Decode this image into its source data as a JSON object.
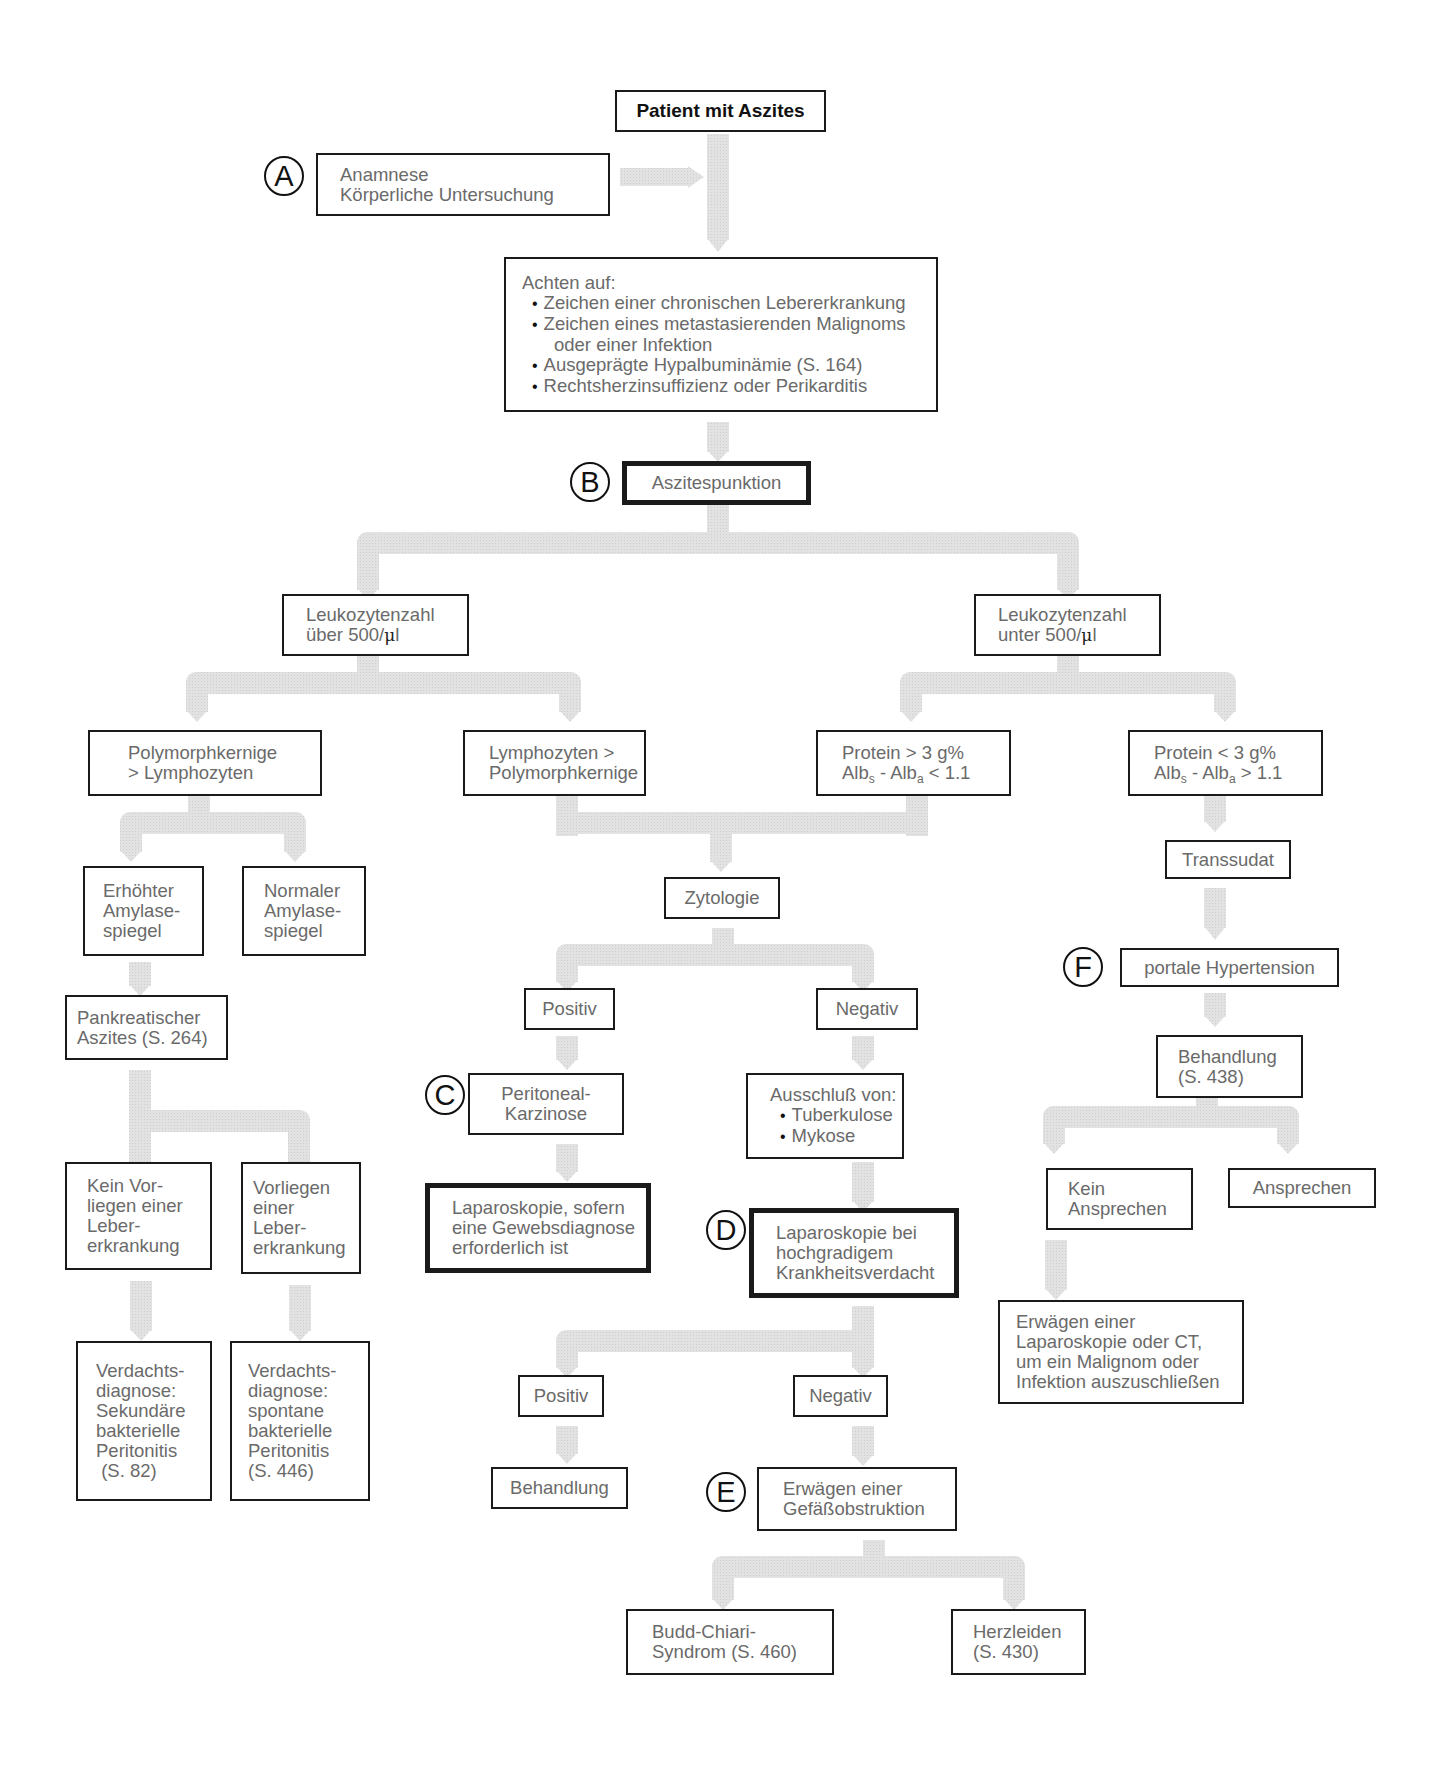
{
  "diagram": {
    "title": "Patient mit Aszites",
    "markers": [
      "A",
      "B",
      "C",
      "D",
      "E",
      "F"
    ],
    "connector_color": "#dcdcdc",
    "border_color": "#1a1a1a",
    "text_color": "#6a6a6a"
  },
  "nodes": {
    "anamnese": {
      "lines": [
        "Anamnese",
        "Körperliche Untersuchung"
      ]
    },
    "achten": {
      "heading": "Achten auf:",
      "bullets": [
        "Zeichen einer chronischen Lebererkrankung",
        "Zeichen eines metastasierenden Malignoms",
        "Ausgeprägte Hypalbuminämie (S. 164)",
        "Rechtsherzinsuffizienz oder Perikarditis"
      ],
      "bullet2_continuation": "oder einer Infektion"
    },
    "punktion": {
      "label": "Aszitespunktion"
    },
    "leuko_hoch": {
      "line1": "Leukozytenzahl",
      "line2_prefix": "über 500/",
      "unit_mu": "μ",
      "unit_l": "l"
    },
    "leuko_niedrig": {
      "line1": "Leukozytenzahl",
      "line2_prefix": "unter 500/",
      "unit_mu": "μ",
      "unit_l": "l"
    },
    "poly_gt_lymph": {
      "lines": [
        "Polymorphkernige",
        "> Lymphozyten"
      ]
    },
    "lymph_gt_poly": {
      "lines": [
        "Lymphozyten >",
        "Polymorphkernige"
      ]
    },
    "protein_hoch": {
      "line1": "Protein > 3 g%",
      "alb": "Alb",
      "sub_s": "s",
      "sub_a": "a",
      "sep": " - ",
      "cmp": " < 1.1"
    },
    "protein_niedrig": {
      "line1": "Protein < 3 g%",
      "alb": "Alb",
      "sub_s": "s",
      "sub_a": "a",
      "sep": " - ",
      "cmp": " > 1.1"
    },
    "amylase_hoch": {
      "lines": [
        "Erhöhter",
        "Amylase-",
        "spiegel"
      ]
    },
    "amylase_normal": {
      "lines": [
        "Normaler",
        "Amylase-",
        "spiegel"
      ]
    },
    "pankreatisch": {
      "lines": [
        "Pankreatischer",
        "Aszites (S. 264)"
      ]
    },
    "kein_leber": {
      "lines": [
        "Kein Vor-",
        "liegen einer",
        "Leber-",
        "erkrankung"
      ]
    },
    "vorliegen_leber": {
      "lines": [
        "Vorliegen",
        "einer",
        "Leber-",
        "erkrankung"
      ]
    },
    "sbp_sekundaer": {
      "lines": [
        "Verdachts-",
        "diagnose:",
        "Sekundäre",
        "bakterielle",
        "Peritonitis",
        " (S. 82)"
      ]
    },
    "sbp_spontan": {
      "lines": [
        "Verdachts-",
        "diagnose:",
        "spontane",
        "bakterielle",
        "Peritonitis",
        "(S. 446)"
      ]
    },
    "zytologie": {
      "label": "Zytologie"
    },
    "zyto_positiv": {
      "label": "Positiv"
    },
    "zyto_negativ": {
      "label": "Negativ"
    },
    "karzinose": {
      "lines": [
        "Peritoneal-",
        "Karzinose"
      ]
    },
    "lap_gewebe": {
      "lines": [
        "Laparoskopie, sofern",
        "eine Gewebsdiagnose",
        "erforderlich ist"
      ]
    },
    "ausschluss": {
      "heading": "Ausschluß von:",
      "bullets": [
        "Tuberkulose",
        "Mykose"
      ]
    },
    "lap_verdacht": {
      "lines": [
        "Laparoskopie bei",
        "hochgradigem",
        "Krankheitsverdacht"
      ]
    },
    "lap_positiv": {
      "label": "Positiv"
    },
    "lap_negativ": {
      "label": "Negativ"
    },
    "behandlung_mid": {
      "label": "Behandlung"
    },
    "gefaess": {
      "lines": [
        "Erwägen einer",
        "Gefäßobstruktion"
      ]
    },
    "budd_chiari": {
      "lines": [
        "Budd-Chiari-",
        "Syndrom (S. 460)"
      ]
    },
    "herzleiden": {
      "lines": [
        "Herzleiden",
        "(S. 430)"
      ]
    },
    "transsudat": {
      "label": "Transsudat"
    },
    "portal": {
      "label": "portale Hypertension"
    },
    "behandlung_right": {
      "lines": [
        "Behandlung",
        "(S. 438)"
      ]
    },
    "kein_ansprechen": {
      "lines": [
        "Kein",
        "Ansprechen"
      ]
    },
    "ansprechen": {
      "label": "Ansprechen"
    },
    "erwaegen_ct": {
      "lines": [
        "Erwägen einer",
        "Laparoskopie oder CT,",
        "um ein Malignom oder",
        "Infektion auszuschließen"
      ]
    }
  }
}
